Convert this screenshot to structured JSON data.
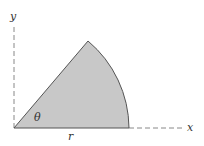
{
  "diagram": {
    "type": "circular-sector",
    "labels": {
      "y_axis": "y",
      "x_axis": "x",
      "angle": "θ",
      "radius": "r"
    },
    "colors": {
      "fill": "#c8c8c8",
      "stroke": "#555555",
      "axis": "#888888"
    }
  }
}
